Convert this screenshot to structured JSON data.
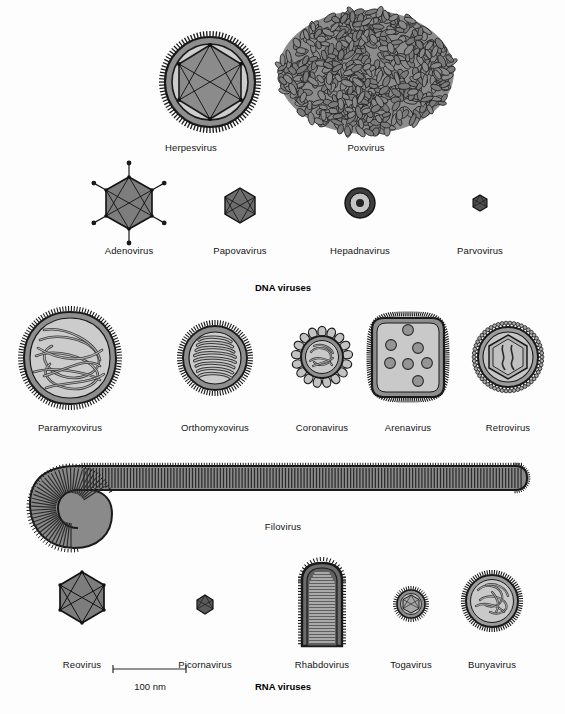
{
  "figure": {
    "title_absent": true,
    "background_color": "#fdfdfd",
    "ink_color": "#1a1a1a",
    "fill_light": "#c9c9c9",
    "fill_mid": "#9a9a9a",
    "fill_dark": "#6f6f6f",
    "fill_darker": "#4a4a4a"
  },
  "sections": {
    "dna": {
      "caption": "DNA viruses"
    },
    "rna": {
      "caption": "RNA viruses"
    }
  },
  "scale_bar": {
    "label": "100 nm",
    "x_start": 113,
    "x_end": 186,
    "y": 677,
    "label_x": 150,
    "label_y": 681
  },
  "viruses": [
    {
      "id": "herpesvirus",
      "label": "Herpesvirus",
      "group": "DNA",
      "cx": 210,
      "cy": 82,
      "r": 52,
      "label_x": 191,
      "label_y": 142,
      "shape": "enveloped-icosahedral"
    },
    {
      "id": "poxvirus",
      "label": "Poxvirus",
      "group": "DNA",
      "cx": 366,
      "cy": 72,
      "rx": 88,
      "ry": 62,
      "label_x": 366,
      "label_y": 142,
      "shape": "brick-granular"
    },
    {
      "id": "adenovirus",
      "label": "Adenovirus",
      "group": "DNA",
      "cx": 129,
      "cy": 203,
      "r": 26,
      "label_x": 129,
      "label_y": 245,
      "shape": "icosahedral-fibers"
    },
    {
      "id": "papovavirus",
      "label": "Papovavirus",
      "group": "DNA",
      "cx": 240,
      "cy": 205,
      "r": 17,
      "label_x": 240,
      "label_y": 245,
      "shape": "icosahedral"
    },
    {
      "id": "hepadnavirus",
      "label": "Hepadnavirus",
      "group": "DNA",
      "cx": 360,
      "cy": 203,
      "r": 16,
      "label_x": 360,
      "label_y": 245,
      "shape": "concentric-rings"
    },
    {
      "id": "parvovirus",
      "label": "Parvovirus",
      "group": "DNA",
      "cx": 480,
      "cy": 203,
      "r": 8,
      "label_x": 480,
      "label_y": 245,
      "shape": "icosahedral-small"
    },
    {
      "id": "paramyxovirus",
      "label": "Paramyxovirus",
      "group": "RNA",
      "cx": 70,
      "cy": 358,
      "r": 46,
      "label_x": 70,
      "label_y": 422,
      "shape": "enveloped-tangled-helix"
    },
    {
      "id": "orthomyxovirus",
      "label": "Orthomyxovirus",
      "group": "RNA",
      "cx": 215,
      "cy": 358,
      "r": 33,
      "label_x": 215,
      "label_y": 422,
      "shape": "enveloped-coil"
    },
    {
      "id": "coronavirus",
      "label": "Coronavirus",
      "group": "RNA",
      "cx": 322,
      "cy": 357,
      "r": 28,
      "label_x": 322,
      "label_y": 422,
      "shape": "club-spikes"
    },
    {
      "id": "arenavirus",
      "label": "Arenavirus",
      "group": "RNA",
      "cx": 408,
      "cy": 357,
      "rx": 36,
      "ry": 43,
      "label_x": 408,
      "label_y": 422,
      "shape": "granular-enveloped"
    },
    {
      "id": "retrovirus",
      "label": "Retrovirus",
      "group": "RNA",
      "cx": 508,
      "cy": 357,
      "r": 31,
      "label_x": 508,
      "label_y": 422,
      "shape": "hex-core-enveloped"
    },
    {
      "id": "filovirus",
      "label": "Filovirus",
      "group": "RNA",
      "label_x": 283,
      "label_y": 521,
      "shape": "filament-hooked"
    },
    {
      "id": "reovirus",
      "label": "Reovirus",
      "group": "RNA",
      "cx": 82,
      "cy": 597,
      "r": 25,
      "label_x": 82,
      "label_y": 659,
      "shape": "icosahedral"
    },
    {
      "id": "picornavirus",
      "label": "Picornavirus",
      "group": "RNA",
      "cx": 205,
      "cy": 604,
      "r": 9,
      "label_x": 205,
      "label_y": 659,
      "shape": "icosahedral-small"
    },
    {
      "id": "rhabdovirus",
      "label": "Rhabdovirus",
      "group": "RNA",
      "cx": 322,
      "cy": 605,
      "label_x": 322,
      "label_y": 659,
      "shape": "bullet-striated"
    },
    {
      "id": "togavirus",
      "label": "Togavirus",
      "group": "RNA",
      "cx": 411,
      "cy": 604,
      "r": 15,
      "label_x": 411,
      "label_y": 659,
      "shape": "enveloped-icosahedral-small"
    },
    {
      "id": "bunyavirus",
      "label": "Bunyavirus",
      "group": "RNA",
      "cx": 492,
      "cy": 601,
      "r": 27,
      "label_x": 492,
      "label_y": 659,
      "shape": "enveloped-tangled"
    }
  ],
  "captions": [
    {
      "id": "dna-caption",
      "text": "DNA viruses",
      "x": 283,
      "y": 282
    },
    {
      "id": "rna-caption",
      "text": "RNA viruses",
      "x": 283,
      "y": 681
    }
  ]
}
